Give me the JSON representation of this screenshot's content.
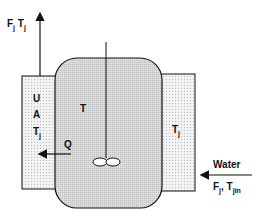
{
  "diagram": {
    "outlet_label": {
      "main": "F",
      "sub1": "j",
      "mid": " T",
      "sub2": "j"
    },
    "jacket_left_labels": [
      "U",
      "A",
      "T",
      "j"
    ],
    "vessel_label": "T",
    "heat_flow_label": "Q",
    "jacket_right_label": {
      "main": "T",
      "sub": "j"
    },
    "inlet_label": "Water",
    "inlet_sub_label": {
      "f": "F",
      "fsub": "j",
      "sep": ", T",
      "tsub": "jin"
    },
    "colors": {
      "line": "#111111",
      "vessel_fill": "#d4d4d4",
      "jacket_fill": "#ececec",
      "background": "#ffffff"
    }
  }
}
